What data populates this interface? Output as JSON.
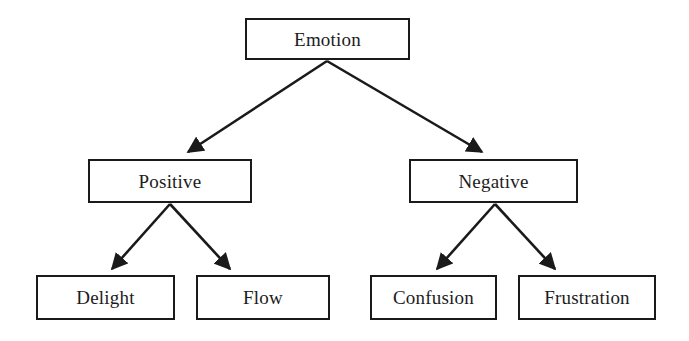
{
  "diagram": {
    "type": "hierarchy-tree",
    "title": "Emotion",
    "canvas": {
      "width": 689,
      "height": 341
    },
    "colors": {
      "background": "#ffffff",
      "node_fill": "#ffffff",
      "node_border": "#1a1a1a",
      "text": "#1c1c1c",
      "edge": "#1a1a1a"
    },
    "nodes": [
      {
        "id": "emotion",
        "label": "Emotion",
        "level": 1,
        "parent": null
      },
      {
        "id": "positive",
        "label": "Positive",
        "level": 2,
        "parent": "emotion"
      },
      {
        "id": "negative",
        "label": "Negative",
        "level": 2,
        "parent": "emotion"
      },
      {
        "id": "delight",
        "label": "Delight",
        "level": 3,
        "parent": "positive"
      },
      {
        "id": "flow",
        "label": "Flow",
        "level": 3,
        "parent": "positive"
      },
      {
        "id": "confusion",
        "label": "Confusion",
        "level": 3,
        "parent": "negative"
      },
      {
        "id": "frustration",
        "label": "Frustration",
        "level": 3,
        "parent": "negative"
      }
    ],
    "edges": [
      {
        "from": "emotion",
        "to": "positive",
        "arrowhead": "filled-triangle"
      },
      {
        "from": "emotion",
        "to": "negative",
        "arrowhead": "filled-triangle"
      },
      {
        "from": "positive",
        "to": "delight",
        "arrowhead": "filled-triangle"
      },
      {
        "from": "positive",
        "to": "flow",
        "arrowhead": "filled-triangle"
      },
      {
        "from": "negative",
        "to": "confusion",
        "arrowhead": "filled-triangle"
      },
      {
        "from": "negative",
        "to": "frustration",
        "arrowhead": "filled-triangle"
      }
    ]
  }
}
